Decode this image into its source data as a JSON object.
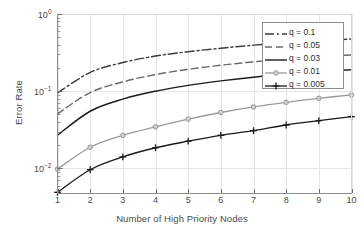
{
  "chart_data": {
    "type": "line",
    "title": "",
    "xlabel": "Number of High Priority Nodes",
    "ylabel": "Error Rate",
    "x": [
      1,
      2,
      3,
      4,
      5,
      6,
      7,
      8,
      9,
      10
    ],
    "xlim": [
      1,
      10
    ],
    "ylim": [
      0.0048,
      1.0
    ],
    "yscale": "log",
    "xtick_labels": [
      "1",
      "2",
      "3",
      "4",
      "5",
      "6",
      "7",
      "8",
      "9",
      "10"
    ],
    "ytick_labels": [
      "10^0",
      "10^-1",
      "10^-2"
    ],
    "ytick_values": [
      1,
      0.1,
      0.01
    ],
    "grid": true,
    "legend_position": "upper right",
    "series": [
      {
        "name": "q = 0.1",
        "style": "dash-dot",
        "color": "#3c3c3c",
        "marker": "none",
        "values": [
          0.095,
          0.175,
          0.235,
          0.285,
          0.325,
          0.36,
          0.395,
          0.425,
          0.45,
          0.475
        ]
      },
      {
        "name": "q = 0.05",
        "style": "dashed",
        "color": "#6a6a6a",
        "marker": "none",
        "values": [
          0.051,
          0.096,
          0.132,
          0.164,
          0.192,
          0.217,
          0.24,
          0.26,
          0.278,
          0.295
        ]
      },
      {
        "name": "q = 0.03",
        "style": "solid",
        "color": "#1c1c1c",
        "marker": "none",
        "values": [
          0.027,
          0.055,
          0.079,
          0.1,
          0.119,
          0.136,
          0.152,
          0.166,
          0.179,
          0.19
        ]
      },
      {
        "name": "q = 0.01",
        "style": "solid",
        "color": "#9a9a9a",
        "marker": "circle",
        "values": [
          0.0098,
          0.0188,
          0.0268,
          0.0345,
          0.0435,
          0.053,
          0.0625,
          0.0718,
          0.0808,
          0.0895
        ]
      },
      {
        "name": "q = 0.005",
        "style": "solid",
        "color": "#1a1a1a",
        "marker": "plus",
        "values": [
          0.0049,
          0.0096,
          0.0141,
          0.0185,
          0.0225,
          0.0268,
          0.0308,
          0.0365,
          0.0415,
          0.0468
        ]
      }
    ]
  }
}
